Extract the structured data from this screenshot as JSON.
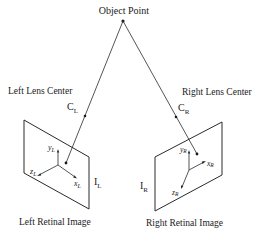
{
  "diagram": {
    "object_point": {
      "label": "Object Point",
      "x": 123,
      "y": 21
    },
    "left": {
      "lens_label": "Left Lens Center",
      "lens_symbol": "C",
      "lens_subscript": "L",
      "image_symbol": "I",
      "image_subscript": "L",
      "retina_label": "Left Retinal Image",
      "axes": {
        "y": "y",
        "z": "z",
        "x": "x",
        "sub": "L"
      }
    },
    "right": {
      "lens_label": "Right Lens Center",
      "lens_symbol": "C",
      "lens_subscript": "R",
      "image_symbol": "I",
      "image_subscript": "R",
      "retina_label": "Right Retinal Image",
      "axes": {
        "y": "y",
        "z": "z",
        "x": "x",
        "sub": "R"
      }
    }
  },
  "colors": {
    "line": "#2a2a2a",
    "background": "#ffffff"
  }
}
